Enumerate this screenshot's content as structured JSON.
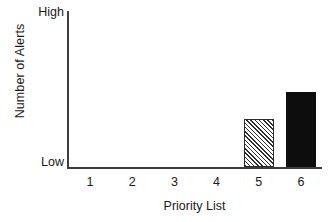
{
  "chart_data": {
    "type": "bar",
    "title": "",
    "xlabel": "Priority List",
    "ylabel": "Number of Alerts",
    "categories": [
      "1",
      "2",
      "3",
      "4",
      "5",
      "6"
    ],
    "values": [
      0,
      0,
      0,
      0,
      0.31,
      0.48
    ],
    "ylim": [
      0,
      1
    ],
    "ytick_labels": [
      "Low",
      "High"
    ],
    "ytick_values": [
      0,
      1
    ],
    "grid": false,
    "legend": null,
    "series": [
      {
        "name": "Alerts",
        "values": [
          0,
          0,
          0,
          0,
          0.31,
          0.48
        ],
        "styles": [
          "none",
          "none",
          "none",
          "none",
          "hatch-diagonal",
          "solid-black"
        ]
      }
    ],
    "colors": {
      "axis": "#3d3d3d",
      "text": "#1a1a1a",
      "bar_solid": "#0d0d0d",
      "bar_hatch_line": "#2f2f2f",
      "bar_hatch_bg": "#ffffff",
      "background": "#ffffff"
    }
  },
  "axis": {
    "y_title": "Number of Alerts",
    "y_tick_top": "High",
    "y_tick_bottom": "Low",
    "x_title": "Priority List"
  },
  "ticks": {
    "x": [
      "1",
      "2",
      "3",
      "4",
      "5",
      "6"
    ]
  }
}
